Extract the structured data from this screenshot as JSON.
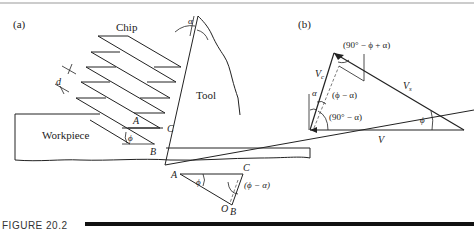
{
  "figure": {
    "caption": "FIGURE 20.2",
    "panel_a": {
      "label": "(a)",
      "chip_label": "Chip",
      "tool_label": "Tool",
      "workpiece_label": "Workpiece",
      "rake_angle": "α",
      "spacing_label": "d",
      "point_A": "A",
      "point_B": "B",
      "point_C": "C",
      "shear_angle": "ϕ",
      "inset": {
        "point_A": "A",
        "point_B": "B",
        "point_C": "C",
        "point_O": "O",
        "angle_phi": "ϕ",
        "angle_phi_minus_alpha": "(ϕ − α)"
      }
    },
    "panel_b": {
      "label": "(b)",
      "vc_label": "V",
      "vc_sub": "c",
      "vs_label": "V",
      "vs_sub": "s",
      "v_label": "V",
      "angle_top": "(90° − ϕ + α)",
      "angle_alpha": "α",
      "angle_phi_minus_alpha": "(ϕ − α)",
      "angle_90_minus_alpha": "(90° − α)",
      "angle_phi": "ϕ"
    }
  }
}
